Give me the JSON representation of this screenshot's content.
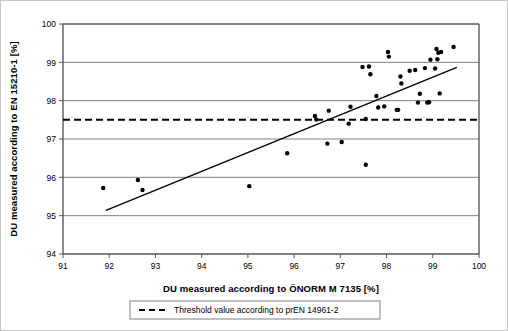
{
  "chart_data": {
    "type": "scatter",
    "title": "",
    "xlabel": "DU measured according to ÖNORM M 7135 [%]",
    "ylabel": "DU measured according to EN 15210-1 [%]",
    "xlim": [
      91,
      100
    ],
    "ylim": [
      94,
      100
    ],
    "xticks": [
      91,
      92,
      93,
      94,
      95,
      96,
      97,
      98,
      99,
      100
    ],
    "yticks": [
      94,
      95,
      96,
      97,
      98,
      99,
      100
    ],
    "xtick_labels": [
      "91",
      "92",
      "93",
      "94",
      "95",
      "96",
      "97",
      "98",
      "99",
      "100"
    ],
    "ytick_labels": [
      "94",
      "95",
      "96",
      "97",
      "98",
      "99",
      "100"
    ],
    "grid": "horizontal",
    "grid_color": "#808080",
    "marker_color": "#000000",
    "marker_shape": "dot",
    "marker_size": 2.2,
    "series": [
      {
        "name": "measurements",
        "type": "scatter",
        "points": [
          [
            91.87,
            95.72
          ],
          [
            92.62,
            95.93
          ],
          [
            92.72,
            95.67
          ],
          [
            95.03,
            95.77
          ],
          [
            95.85,
            96.63
          ],
          [
            96.45,
            97.6
          ],
          [
            96.48,
            97.51
          ],
          [
            96.72,
            96.88
          ],
          [
            96.75,
            97.74
          ],
          [
            97.03,
            96.92
          ],
          [
            97.18,
            97.4
          ],
          [
            97.22,
            97.84
          ],
          [
            97.48,
            98.88
          ],
          [
            97.55,
            97.52
          ],
          [
            97.55,
            96.33
          ],
          [
            97.62,
            98.89
          ],
          [
            97.65,
            98.69
          ],
          [
            97.78,
            98.12
          ],
          [
            97.82,
            97.82
          ],
          [
            97.95,
            97.85
          ],
          [
            98.03,
            99.27
          ],
          [
            98.05,
            99.15
          ],
          [
            98.22,
            97.76
          ],
          [
            98.25,
            97.76
          ],
          [
            98.3,
            98.63
          ],
          [
            98.32,
            98.45
          ],
          [
            98.5,
            98.78
          ],
          [
            98.62,
            98.8
          ],
          [
            98.68,
            97.95
          ],
          [
            98.72,
            98.18
          ],
          [
            98.83,
            98.85
          ],
          [
            98.88,
            97.95
          ],
          [
            98.92,
            97.96
          ],
          [
            98.95,
            99.07
          ],
          [
            99.05,
            98.84
          ],
          [
            99.08,
            99.35
          ],
          [
            99.1,
            99.08
          ],
          [
            99.12,
            99.25
          ],
          [
            99.15,
            98.19
          ],
          [
            99.18,
            99.27
          ],
          [
            99.45,
            99.4
          ]
        ]
      },
      {
        "name": "regression-line",
        "type": "line",
        "points": [
          [
            91.93,
            95.14
          ],
          [
            99.52,
            98.87
          ]
        ]
      }
    ],
    "threshold": {
      "value": 97.5,
      "style": "dashed",
      "color": "#000000",
      "label": "Threshold value according to prEN 14961-2"
    },
    "legend": {
      "position": "bottom",
      "entries": [
        {
          "label": "Threshold value according to prEN 14961-2",
          "style": "dashed",
          "color": "#000000"
        }
      ]
    }
  }
}
